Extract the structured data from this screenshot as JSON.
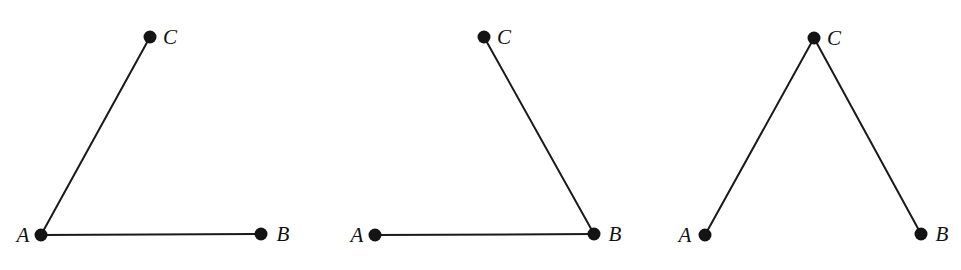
{
  "page": {
    "background_color": "#ffffff",
    "width": 961,
    "height": 270
  },
  "style": {
    "stroke_color": "#1a1a1a",
    "dot_color": "#141414",
    "label_color": "#111111",
    "stroke_width": 2,
    "dot_radius": 6.5,
    "label_font_size": 21
  },
  "figures": [
    {
      "id": "figure-1",
      "name": "acute-angle-at-a",
      "vertices": [
        {
          "id": "A",
          "label": "A",
          "x": 41,
          "y": 235,
          "label_x": 23,
          "label_y": 242
        },
        {
          "id": "B",
          "label": "B",
          "x": 261,
          "y": 234,
          "label_x": 283,
          "label_y": 241
        },
        {
          "id": "C",
          "label": "C",
          "x": 150,
          "y": 37,
          "label_x": 170,
          "label_y": 44
        }
      ],
      "edges": [
        {
          "id": "AB",
          "from": "A",
          "to": "B"
        },
        {
          "id": "AC",
          "from": "A",
          "to": "C"
        }
      ]
    },
    {
      "id": "figure-2",
      "name": "right-ish-angle-at-b",
      "vertices": [
        {
          "id": "A",
          "label": "A",
          "x": 375,
          "y": 235,
          "label_x": 357,
          "label_y": 242
        },
        {
          "id": "B",
          "label": "B",
          "x": 594,
          "y": 234,
          "label_x": 615,
          "label_y": 241
        },
        {
          "id": "C",
          "label": "C",
          "x": 484,
          "y": 37,
          "label_x": 504,
          "label_y": 44
        }
      ],
      "edges": [
        {
          "id": "AB",
          "from": "A",
          "to": "B"
        },
        {
          "id": "BC",
          "from": "B",
          "to": "C"
        }
      ]
    },
    {
      "id": "figure-3",
      "name": "apex-angle-at-c",
      "vertices": [
        {
          "id": "A",
          "label": "A",
          "x": 705,
          "y": 235,
          "label_x": 685,
          "label_y": 242
        },
        {
          "id": "B",
          "label": "B",
          "x": 921,
          "y": 234,
          "label_x": 942,
          "label_y": 241
        },
        {
          "id": "C",
          "label": "C",
          "x": 814,
          "y": 38,
          "label_x": 834,
          "label_y": 45
        }
      ],
      "edges": [
        {
          "id": "CA",
          "from": "C",
          "to": "A"
        },
        {
          "id": "CB",
          "from": "C",
          "to": "B"
        }
      ]
    }
  ]
}
